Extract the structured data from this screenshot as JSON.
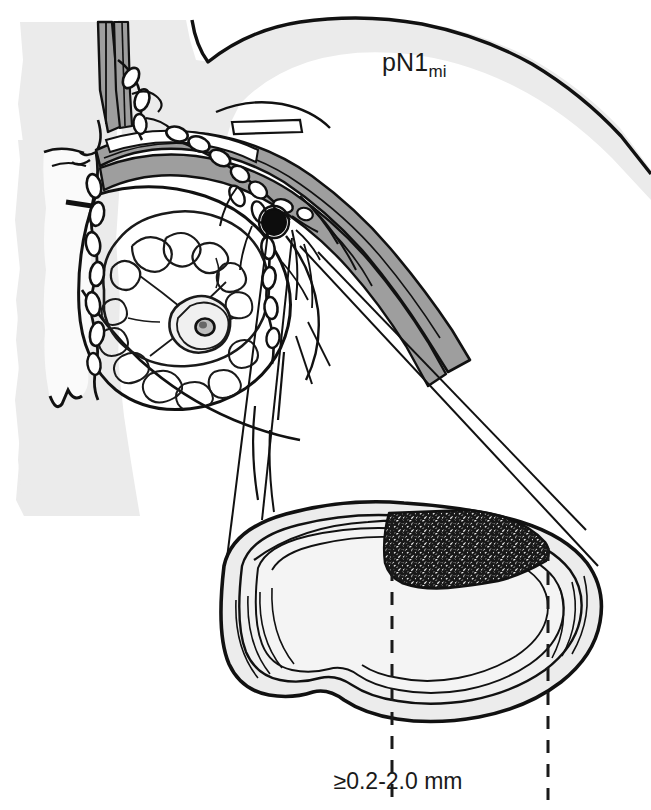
{
  "figure": {
    "title_label": "pN1",
    "title_subscript": "mi",
    "size_label": "≥0.2-2.0 mm",
    "colors": {
      "body_fill": "#ebebeb",
      "sternum_fill": "#f7f7f7",
      "vessel_fill": "#9e9e9e",
      "node_fill": "#f0f0f0",
      "node_rim_fill": "#e2e2e2",
      "tumor_fill": "#262626",
      "outline": "#111111",
      "background": "#ffffff"
    }
  },
  "parts": {
    "torso": "torso-outline",
    "sternum": "sternum-region",
    "breast": "breast-outline",
    "gland": "mammary-gland",
    "nipple": "nipple-areola",
    "axillary_vessels": "axillary-vessel-bundle",
    "subclavian_vessels": "subclavian-vessel-bundle",
    "internal_mammary_chain": "internal-mammary-node-chain",
    "axillary_chain": "axillary-node-chain",
    "sentinel_node": "sentinel-node-filled",
    "leader_lines": "magnifier-leader-lines",
    "magnified_node": "magnified-lymph-node",
    "node_capsule": "node-capsule-layers",
    "tumor_deposit": "micrometastasis-deposit",
    "measure_left": "measure-line-left",
    "measure_right": "measure-line-right"
  }
}
